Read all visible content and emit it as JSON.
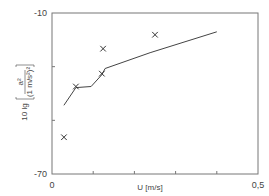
{
  "chart_data": {
    "type": "line",
    "title": "",
    "xlabel": "U [m/s]",
    "ylabel": "10 lg [a² / (1 m/s²)²]",
    "ylabel_parts": {
      "prefix": "10 lg",
      "numerator": "a²",
      "denominator": "(1 m/s²)²"
    },
    "xlim": [
      0,
      0.5
    ],
    "ylim": [
      -70,
      -10
    ],
    "x_tick_labels": [
      "0",
      "0,5"
    ],
    "x_ticks": [
      0,
      0.1,
      0.2,
      0.3,
      0.4,
      0.5
    ],
    "y_tick_labels": [
      "-10",
      "-70"
    ],
    "y_ticks": [
      -10,
      -30,
      -50,
      -70
    ],
    "grid": false,
    "legend": null,
    "series": [
      {
        "name": "curve",
        "style": "line",
        "x": [
          0.029,
          0.058,
          0.095,
          0.121,
          0.129,
          0.238,
          0.4
        ],
        "y": [
          -44.4,
          -37.8,
          -37.4,
          -33.0,
          -30.7,
          -24.8,
          -17.0
        ]
      },
      {
        "name": "measurements",
        "style": "marker-x",
        "x": [
          0.029,
          0.058,
          0.121,
          0.124,
          0.25
        ],
        "y": [
          -56.3,
          -37.4,
          -32.6,
          -23.3,
          -18.1
        ]
      }
    ],
    "colors": {
      "frame": "#777777",
      "line": "#444444",
      "marker": "#333333"
    }
  }
}
